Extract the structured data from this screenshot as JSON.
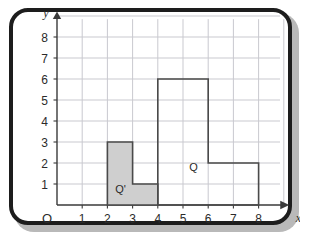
{
  "figure": {
    "frame_color": "#1d1d1d",
    "background_color": "#ffffff",
    "shadow_color": "#b9b9b9"
  },
  "chart_data": {
    "type": "scatter",
    "title": "",
    "subtitle": "",
    "xlabel": "x",
    "ylabel": "y",
    "origin_label": "O",
    "grid": true,
    "grid_color": "#c9c9cf",
    "axis_color": "#3a3a3a",
    "xlim": [
      0,
      8.6
    ],
    "ylim": [
      0,
      8.6
    ],
    "xticks": [
      1,
      2,
      3,
      4,
      5,
      6,
      7,
      8
    ],
    "yticks": [
      1,
      2,
      3,
      4,
      5,
      6,
      7,
      8
    ],
    "xtick_labels": [
      "1",
      "2",
      "3",
      "4",
      "5",
      "6",
      "7",
      "8"
    ],
    "ytick_labels": [
      "1",
      "2",
      "3",
      "4",
      "5",
      "6",
      "7",
      "8"
    ],
    "legend": "none",
    "annotations": [
      {
        "text": "Q'",
        "x": 2.52,
        "y": 0.55
      },
      {
        "text": "Q",
        "x": 5.42,
        "y": 1.62
      }
    ],
    "series": [
      {
        "name": "Q'",
        "label": "Q'",
        "type": "polygon",
        "fill": "#cfcfcf",
        "stroke": "#4a4a4a",
        "stroke_width": 1.6,
        "points": [
          [
            2,
            0
          ],
          [
            2,
            3
          ],
          [
            3,
            3
          ],
          [
            3,
            1
          ],
          [
            4,
            1
          ],
          [
            4,
            0
          ]
        ]
      },
      {
        "name": "Q",
        "label": "Q",
        "type": "polygon",
        "fill": "none",
        "stroke": "#4a4a4a",
        "stroke_width": 1.6,
        "points": [
          [
            4,
            0
          ],
          [
            4,
            6
          ],
          [
            6,
            6
          ],
          [
            6,
            2
          ],
          [
            8,
            2
          ],
          [
            8,
            0
          ]
        ]
      }
    ]
  }
}
